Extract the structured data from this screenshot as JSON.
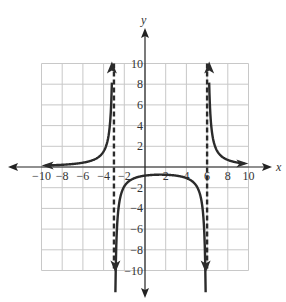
{
  "chart_data": {
    "type": "line",
    "title": "",
    "xlabel": "x",
    "ylabel": "y",
    "xlim": [
      -10,
      10
    ],
    "ylim": [
      -10,
      10
    ],
    "grid": true,
    "grid_step": 2,
    "x_ticks": [
      -10,
      -8,
      -6,
      -4,
      -2,
      2,
      4,
      6,
      8,
      10
    ],
    "y_ticks": [
      -10,
      -8,
      -6,
      -4,
      -2,
      2,
      4,
      6,
      8,
      10
    ],
    "x_tick_labels": [
      "-10",
      "-8",
      "-6",
      "-4",
      "-2",
      "2",
      "4",
      "6",
      "8",
      "10"
    ],
    "y_tick_labels": [
      "-10",
      "-8",
      "-6",
      "-4",
      "-2",
      "2",
      "4",
      "6",
      "8",
      "10"
    ],
    "vertical_asymptotes": [
      -3,
      6
    ],
    "horizontal_asymptote": 0,
    "function_description": "Rational function f(x) = k/((x+3)(x-6)), k≈15",
    "k": 15,
    "series": [
      {
        "name": "left branch",
        "x": [
          -10,
          -8,
          -6,
          -5,
          -4,
          -3.5,
          -3.2
        ],
        "y": [
          0.13,
          0.21,
          0.42,
          0.68,
          1.5,
          3.1,
          7.4
        ]
      },
      {
        "name": "middle branch",
        "x": [
          -2.8,
          -2.5,
          -2,
          0,
          1.5,
          3,
          5,
          5.5,
          5.8
        ],
        "y": [
          -8.8,
          -3.5,
          -1.9,
          -0.83,
          -0.74,
          -0.83,
          -1.9,
          -3.5,
          -8.8
        ]
      },
      {
        "name": "right branch",
        "x": [
          6.2,
          6.5,
          7,
          8,
          9,
          10
        ],
        "y": [
          8.3,
          3.2,
          1.5,
          0.68,
          0.42,
          0.29
        ]
      }
    ],
    "colors": {
      "curve": "#2b2b2b",
      "asymptote": "#2b2b2b",
      "grid": "#c8c8c8",
      "axis": "#222222"
    }
  }
}
